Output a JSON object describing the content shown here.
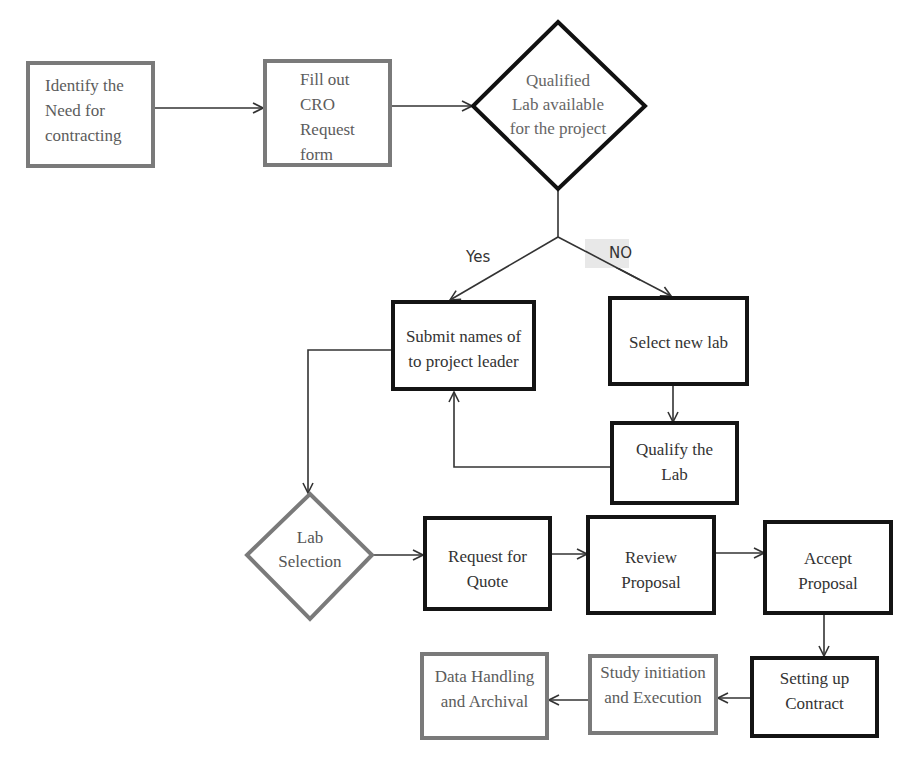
{
  "diagram": {
    "colors": {
      "dark_border": "#141414",
      "gray_border": "#7a7a7a",
      "line": "#333333",
      "no_label_bg": "#e8e8e8"
    },
    "nodes": {
      "identify_need": {
        "label": "Identify the\nNeed for\ncontracting",
        "shape": "rectangle"
      },
      "fill_cro_form": {
        "label": "Fill out\nCRO\nRequest\nform",
        "shape": "rectangle"
      },
      "qualified_lab": {
        "label": "Qualified\nLab available\nfor the project",
        "shape": "diamond"
      },
      "submit_names": {
        "label": "Submit names of\nto project leader",
        "shape": "rectangle"
      },
      "select_new_lab": {
        "label": "Select new lab",
        "shape": "rectangle"
      },
      "qualify_lab": {
        "label": "Qualify the\nLab",
        "shape": "rectangle"
      },
      "lab_selection": {
        "label": "Lab\nSelection",
        "shape": "diamond"
      },
      "request_quote": {
        "label": "Request for\nQuote",
        "shape": "rectangle"
      },
      "review_proposal": {
        "label": "Review\nProposal",
        "shape": "rectangle"
      },
      "accept_proposal": {
        "label": "Accept\nProposal",
        "shape": "rectangle"
      },
      "setting_contract": {
        "label": "Setting up\nContract",
        "shape": "rectangle"
      },
      "study_initiation": {
        "label": "Study initiation\nand Execution",
        "shape": "rectangle"
      },
      "data_handling": {
        "label": "Data Handling\nand Archival",
        "shape": "rectangle"
      }
    },
    "edges": {
      "yes_label": "Yes",
      "no_label": "NO"
    },
    "edge_list": [
      {
        "from": "identify_need",
        "to": "fill_cro_form"
      },
      {
        "from": "fill_cro_form",
        "to": "qualified_lab"
      },
      {
        "from": "qualified_lab",
        "to": "submit_names",
        "label": "Yes"
      },
      {
        "from": "qualified_lab",
        "to": "select_new_lab",
        "label": "NO"
      },
      {
        "from": "select_new_lab",
        "to": "qualify_lab"
      },
      {
        "from": "qualify_lab",
        "to": "submit_names"
      },
      {
        "from": "submit_names",
        "to": "lab_selection"
      },
      {
        "from": "lab_selection",
        "to": "request_quote"
      },
      {
        "from": "request_quote",
        "to": "review_proposal"
      },
      {
        "from": "review_proposal",
        "to": "accept_proposal"
      },
      {
        "from": "accept_proposal",
        "to": "setting_contract"
      },
      {
        "from": "setting_contract",
        "to": "study_initiation"
      },
      {
        "from": "study_initiation",
        "to": "data_handling"
      }
    ]
  }
}
